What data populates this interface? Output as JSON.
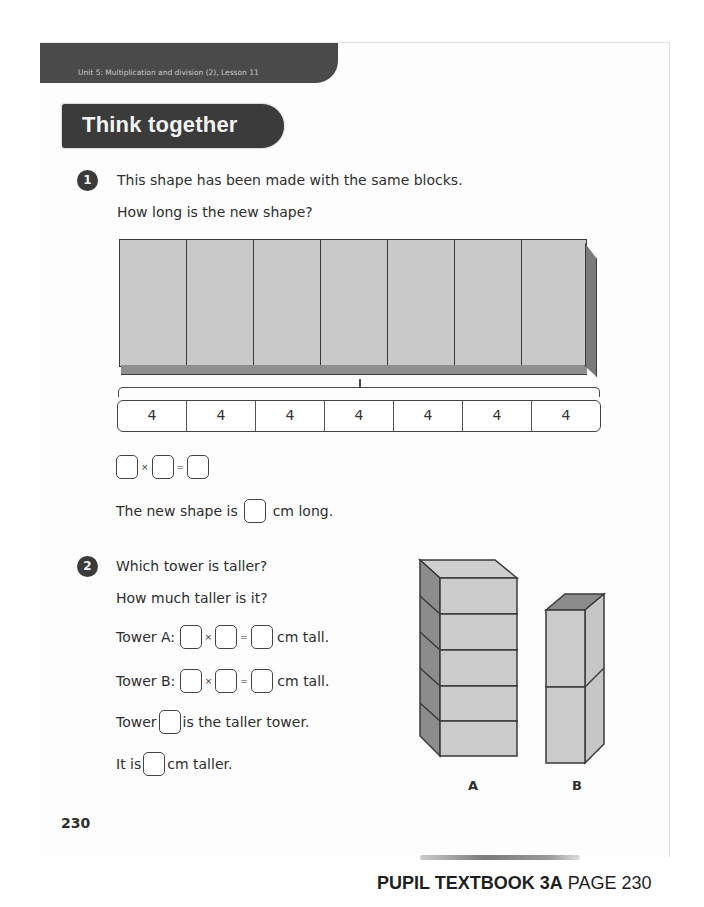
{
  "header": {
    "unit_lesson": "Unit 5: Multiplication and division (2), Lesson 11",
    "section_title": "Think together"
  },
  "question1": {
    "number": "1",
    "line1": "This shape has been made with the same blocks.",
    "line2": "How long is the new shape?",
    "block_count": 7,
    "bar_model_values": [
      "4",
      "4",
      "4",
      "4",
      "4",
      "4",
      "4"
    ],
    "equation": {
      "times": "×",
      "equals": "="
    },
    "answer_prefix": "The new shape is",
    "answer_suffix": "cm long."
  },
  "question2": {
    "number": "2",
    "line1": "Which tower is taller?",
    "line2": "How much taller is it?",
    "tower_a_label": "Tower A:",
    "tower_b_label": "Tower B:",
    "tall_suffix": "cm tall.",
    "times": "×",
    "equals": "=",
    "taller_prefix": "Tower",
    "taller_suffix": "is the taller tower.",
    "diff_prefix": "It is",
    "diff_suffix": "cm taller.",
    "towers": [
      {
        "label": "A",
        "blocks": 5
      },
      {
        "label": "B",
        "blocks": 2
      }
    ]
  },
  "page_number": "230",
  "footer": {
    "book": "PUPIL TEXTBOOK 3A",
    "page": "PAGE 230"
  }
}
